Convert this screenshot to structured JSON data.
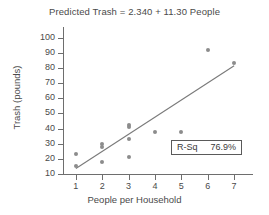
{
  "chart_data": {
    "type": "scatter",
    "title": "Predicted Trash = 2.340 + 11.30 People",
    "xlabel": "People per Household",
    "ylabel": "Trash (pounds)",
    "xlim": [
      0.55,
      7.45
    ],
    "ylim": [
      10,
      103
    ],
    "xticks": [
      1,
      2,
      3,
      4,
      5,
      6,
      7
    ],
    "yticks": [
      10,
      20,
      30,
      40,
      50,
      60,
      70,
      80,
      90,
      100
    ],
    "grid": false,
    "legend": "none",
    "points": [
      {
        "x": 1,
        "y": 23
      },
      {
        "x": 1,
        "y": 15
      },
      {
        "x": 2,
        "y": 30
      },
      {
        "x": 2,
        "y": 28
      },
      {
        "x": 2,
        "y": 18
      },
      {
        "x": 3,
        "y": 42
      },
      {
        "x": 3,
        "y": 41
      },
      {
        "x": 3,
        "y": 33
      },
      {
        "x": 3,
        "y": 21
      },
      {
        "x": 4,
        "y": 38
      },
      {
        "x": 5,
        "y": 38
      },
      {
        "x": 6,
        "y": 92
      },
      {
        "x": 7,
        "y": 83
      }
    ],
    "fit_line": {
      "intercept": 2.34,
      "slope": 11.3,
      "x_start": 1,
      "x_end": 7,
      "y_start": 13.64,
      "y_end": 81.44,
      "color": "#7a7a7a"
    },
    "annotations": [
      {
        "name": "r-squared",
        "label": "R-Sq",
        "value": "76.9%"
      }
    ],
    "marker_color": "#8c8c8c",
    "axis_color": "#6e6e6e"
  }
}
